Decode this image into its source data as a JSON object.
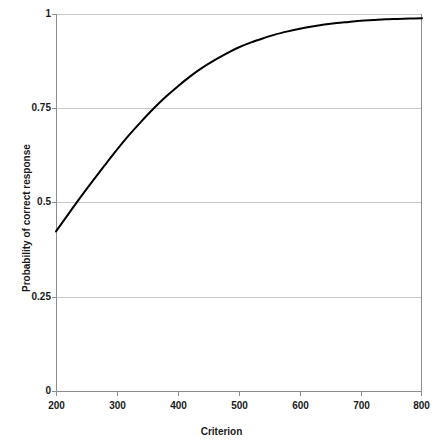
{
  "chart_data": {
    "type": "line",
    "title": "",
    "xlabel": "Criterion",
    "ylabel": "Probability of correct response",
    "xlim": [
      200,
      800
    ],
    "ylim": [
      0,
      1
    ],
    "xticks": [
      200,
      300,
      400,
      500,
      600,
      700,
      800
    ],
    "xtick_labels": [
      "200",
      "300",
      "400",
      "500",
      "600",
      "700",
      "800"
    ],
    "yticks": [
      0,
      0.25,
      0.5,
      0.75,
      1
    ],
    "ytick_labels": [
      "0",
      "0.25",
      "0.5",
      "0.75",
      "1"
    ],
    "grid": "horizontal",
    "grid_color": "#c8c8c8",
    "legend": "none",
    "series": [
      {
        "name": "Probability of correct response",
        "color": "#000000",
        "line_width": 2,
        "x": [
          200,
          220,
          240,
          260,
          280,
          300,
          320,
          340,
          360,
          380,
          400,
          420,
          440,
          460,
          480,
          500,
          520,
          540,
          560,
          580,
          600,
          620,
          640,
          660,
          680,
          700,
          720,
          740,
          760,
          780,
          800
        ],
        "y": [
          0.425,
          0.47,
          0.515,
          0.558,
          0.6,
          0.641,
          0.68,
          0.716,
          0.75,
          0.781,
          0.809,
          0.835,
          0.858,
          0.878,
          0.896,
          0.912,
          0.925,
          0.936,
          0.946,
          0.954,
          0.961,
          0.967,
          0.972,
          0.976,
          0.979,
          0.982,
          0.984,
          0.986,
          0.987,
          0.988,
          0.989
        ]
      }
    ]
  },
  "axis_labels": {
    "x": "Criterion",
    "y": "Probability of correct response"
  },
  "ticks": {
    "x": [
      "200",
      "300",
      "400",
      "500",
      "600",
      "700",
      "800"
    ],
    "y": [
      "1",
      "0.75",
      "0.5",
      "0.25",
      "0"
    ]
  }
}
